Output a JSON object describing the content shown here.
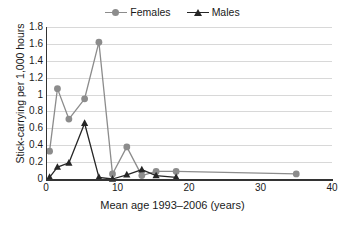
{
  "chart_data": {
    "type": "line",
    "title": "",
    "xlabel": "Mean age 1993–2006 (years)",
    "ylabel": "Stick-carrying per 1,000 hours",
    "xlim": [
      0,
      40
    ],
    "ylim": [
      0,
      1.8
    ],
    "xticks": [
      "0",
      "10",
      "20",
      "30",
      "40"
    ],
    "xtick_values": [
      0,
      10,
      20,
      30,
      40
    ],
    "yticks": [
      "0",
      "0.2",
      "0.4",
      "0.6",
      "0.8",
      "1",
      "1.2",
      "1.4",
      "1.6",
      "1.8"
    ],
    "ytick_values": [
      0,
      0.2,
      0.4,
      0.6,
      0.8,
      1.0,
      1.2,
      1.4,
      1.6,
      1.8
    ],
    "grid": "horizontal",
    "legend_position": "top-center",
    "series": [
      {
        "name": "Females",
        "marker": "circle",
        "color": "#8c8c8c",
        "x": [
          0.5,
          1.6,
          3.2,
          5.4,
          7.4,
          9.3,
          11.3,
          13.4,
          15.4,
          18.2,
          35.0
        ],
        "y": [
          0.33,
          1.07,
          0.71,
          0.95,
          1.62,
          0.06,
          0.38,
          0.04,
          0.09,
          0.09,
          0.06
        ]
      },
      {
        "name": "Males",
        "marker": "triangle",
        "color": "#262626",
        "x": [
          0.5,
          1.6,
          3.2,
          5.4,
          7.4,
          9.3,
          11.3,
          13.4,
          15.4,
          18.2
        ],
        "y": [
          0.02,
          0.14,
          0.19,
          0.66,
          0.02,
          0.0,
          0.05,
          0.11,
          0.04,
          0.02
        ]
      }
    ]
  },
  "legend": {
    "entries": [
      {
        "label": "Females"
      },
      {
        "label": "Males"
      }
    ]
  },
  "colors": {
    "females": "#8c8c8c",
    "males": "#262626",
    "grid": "#d8d8d8",
    "axis": "#333333",
    "text": "#1a1a1a",
    "background": "#ffffff"
  }
}
